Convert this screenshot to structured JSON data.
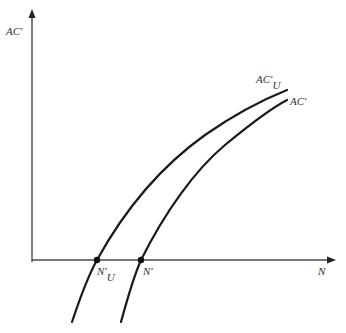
{
  "axes": {
    "y_label": "AC'",
    "x_label": "N"
  },
  "curves": [
    {
      "id": "acu",
      "label_main": "AC'",
      "label_sub": "U"
    },
    {
      "id": "ac",
      "label_main": "AC'"
    }
  ],
  "points": [
    {
      "id": "nu",
      "label_main": "N'",
      "label_sub": "U"
    },
    {
      "id": "n",
      "label_main": "N'"
    }
  ],
  "colors": {
    "axis": "#4a4a4a",
    "curve": "#1a1a1a",
    "text": "#333333"
  }
}
